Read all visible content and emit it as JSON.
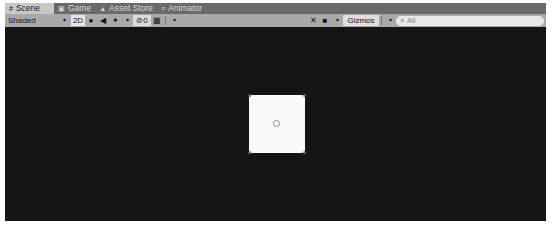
{
  "tabs": [
    {
      "label": "Scene",
      "icon": "scene-icon",
      "glyph": "#",
      "active": true
    },
    {
      "label": "Game",
      "icon": "game-icon",
      "glyph": "▣",
      "active": false
    },
    {
      "label": "Asset Store",
      "icon": "asset-store-icon",
      "glyph": "▲",
      "active": false
    },
    {
      "label": "Animator",
      "icon": "animator-icon",
      "glyph": "≡",
      "active": false
    }
  ],
  "toolbar": {
    "draw_mode": "Shaded",
    "mode_2d_label": "2D",
    "lighting_glyph": "💡",
    "audio_glyph": "◀",
    "effects_glyph": "✦",
    "hidden_count": "0",
    "hidden_glyph": "⊘",
    "grid_glyph": "▦",
    "tools_glyph": "✕",
    "camera_glyph": "■",
    "gizmos_label": "Gizmos",
    "search_placeholder": "All",
    "search_glyph": "⌕",
    "caret": "▾"
  },
  "scene": {
    "object": "white square sprite with pivot gizmo"
  }
}
